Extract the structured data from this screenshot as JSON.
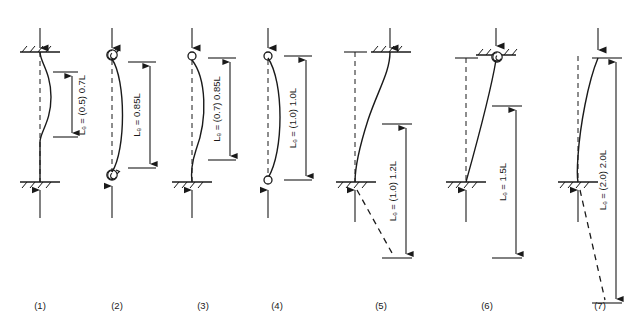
{
  "figure": {
    "background_color": "#ffffff",
    "line_color": "#1a1a1a",
    "case_count": 7
  },
  "cases": [
    {
      "number": "(1)",
      "label": "Lₑ = (0.5) 0.7L",
      "le_factor_theoretical": 0.5,
      "le_factor_design": 0.7,
      "top_support": "fixed",
      "bottom_support": "fixed",
      "sway": false,
      "buckled_shape": "double-curvature",
      "top_load_arrow": "down",
      "bottom_load_arrow": "up",
      "dimension_from": "interior",
      "dashed_extension": false
    },
    {
      "number": "(2)",
      "label": "Lₑ = 0.85L",
      "le_factor_theoretical": null,
      "le_factor_design": 0.85,
      "top_support": "rotational-spring",
      "bottom_support": "rotational-spring",
      "sway": false,
      "buckled_shape": "single-bow",
      "top_load_arrow": "down",
      "bottom_load_arrow": "up",
      "dimension_from": "interior",
      "dashed_extension": false
    },
    {
      "number": "(3)",
      "label": "Lₑ = (0.7) 0.85L",
      "le_factor_theoretical": 0.7,
      "le_factor_design": 0.85,
      "top_support": "pinned",
      "bottom_support": "fixed",
      "sway": false,
      "buckled_shape": "single-curvature-fixed-base",
      "top_load_arrow": "down",
      "bottom_load_arrow": "up",
      "dimension_from": "interior",
      "dashed_extension": false
    },
    {
      "number": "(4)",
      "label": "Lₑ = (1.0) 1.0L",
      "le_factor_theoretical": 1.0,
      "le_factor_design": 1.0,
      "top_support": "pinned",
      "bottom_support": "pinned",
      "sway": false,
      "buckled_shape": "single-bow",
      "top_load_arrow": "down",
      "bottom_load_arrow": "up",
      "dimension_from": "full-height",
      "dashed_extension": false
    },
    {
      "number": "(5)",
      "label": "Lₑ = (1.0) 1.2L",
      "le_factor_theoretical": 1.0,
      "le_factor_design": 1.2,
      "top_support": "fixed-sway",
      "bottom_support": "fixed",
      "sway": true,
      "buckled_shape": "sway-double-curvature",
      "top_load_arrow": "down",
      "bottom_load_arrow": "up",
      "dimension_from": "extended-below",
      "dashed_extension": true
    },
    {
      "number": "(6)",
      "label": "Lₑ = 1.5L",
      "le_factor_theoretical": null,
      "le_factor_design": 1.5,
      "top_support": "spring-sway",
      "bottom_support": "fixed",
      "sway": true,
      "buckled_shape": "sway-leaning",
      "top_load_arrow": "down",
      "bottom_load_arrow": "up",
      "dimension_from": "extended-below",
      "dashed_extension": false
    },
    {
      "number": "(7)",
      "label": "Lₑ = (2.0) 2.0L",
      "le_factor_theoretical": 2.0,
      "le_factor_design": 2.0,
      "top_support": "free",
      "bottom_support": "fixed",
      "sway": true,
      "buckled_shape": "cantilever",
      "top_load_arrow": "down",
      "bottom_load_arrow": "up",
      "dimension_from": "extended-below",
      "dashed_extension": true
    }
  ]
}
